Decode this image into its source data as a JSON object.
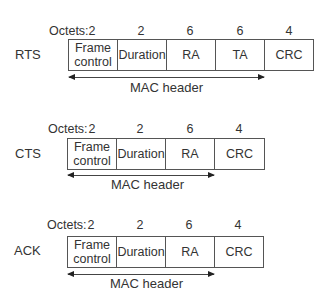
{
  "diagram": {
    "title": "",
    "octets_label": "Octets:",
    "mac_header_label": "MAC header",
    "frames": [
      {
        "name": "RTS",
        "fields": [
          {
            "label": "Frame control",
            "octets": "2"
          },
          {
            "label": "Duration",
            "octets": "2"
          },
          {
            "label": "RA",
            "octets": "6"
          },
          {
            "label": "TA",
            "octets": "6"
          },
          {
            "label": "CRC",
            "octets": "4"
          }
        ]
      },
      {
        "name": "CTS",
        "fields": [
          {
            "label": "Frame control",
            "octets": "2"
          },
          {
            "label": "Duration",
            "octets": "2"
          },
          {
            "label": "RA",
            "octets": "6"
          },
          {
            "label": "CRC",
            "octets": "4"
          }
        ]
      },
      {
        "name": "ACK",
        "fields": [
          {
            "label": "Frame control",
            "octets": "2"
          },
          {
            "label": "Duration",
            "octets": "2"
          },
          {
            "label": "RA",
            "octets": "6"
          },
          {
            "label": "CRC",
            "octets": "4"
          }
        ]
      }
    ]
  },
  "labels": {
    "frame_control_line1": "Frame",
    "frame_control_line2": "control"
  },
  "colors": {
    "line": "#555555",
    "text": "#333333",
    "background": "#ffffff"
  }
}
